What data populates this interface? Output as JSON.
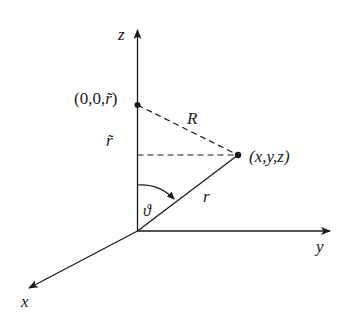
{
  "diagram": {
    "title": "",
    "type": "3d-coordinate-system",
    "axes": {
      "z": {
        "label": "z"
      },
      "y": {
        "label": "y"
      },
      "x": {
        "label": "x"
      }
    },
    "points": {
      "source": {
        "label": "(0,0,r̃)",
        "prefix": "(0,0,",
        "var": "r̃",
        "suffix": ")"
      },
      "field": {
        "label": "(x,y,z)"
      },
      "origin": {
        "label": ""
      }
    },
    "segments": {
      "R": {
        "label": "R",
        "style": "dashed"
      },
      "r": {
        "label": "r",
        "style": "solid"
      },
      "r_tilde": {
        "label": "r̃"
      },
      "projection": {
        "label": "",
        "style": "dashed"
      }
    },
    "angle": {
      "label": "ϑ"
    },
    "colors": {
      "ink": "#1a1a1a",
      "background": "#ffffff"
    }
  }
}
